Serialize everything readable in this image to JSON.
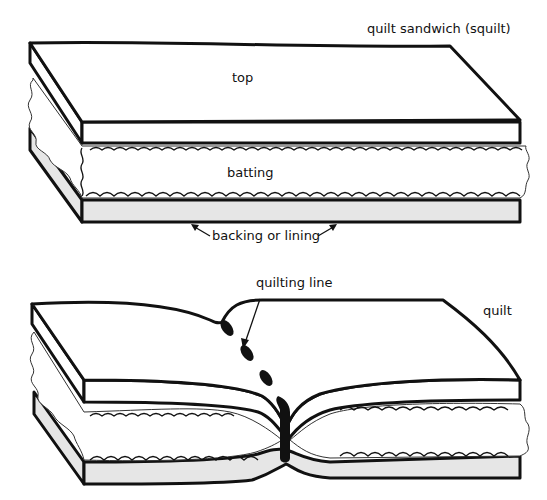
{
  "diagram": {
    "title_top": "quilt sandwich (squilt)",
    "title_bottom": "quilt",
    "layers": {
      "top": "top",
      "batting": "batting",
      "backing": "backing or lining"
    },
    "annotation": "quilting line",
    "colors": {
      "ink": "#111111",
      "background": "#ffffff",
      "backing_fill": "#e6e6e6"
    }
  }
}
